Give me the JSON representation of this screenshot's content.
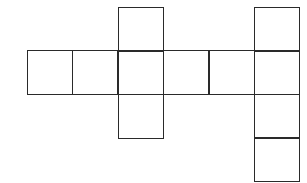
{
  "diagram": {
    "type": "cube-net-like grid of squares",
    "line_color": "#2a2a2a",
    "background": "#ffffff",
    "cell_size": 45,
    "cells": [
      {
        "name": "top-middle",
        "x": 118,
        "y": 7
      },
      {
        "name": "row-1",
        "x": 27,
        "y": 50
      },
      {
        "name": "row-2",
        "x": 72,
        "y": 50
      },
      {
        "name": "row-3-center",
        "x": 118,
        "y": 50
      },
      {
        "name": "row-4",
        "x": 163,
        "y": 50
      },
      {
        "name": "row-5",
        "x": 209,
        "y": 50
      },
      {
        "name": "bottom-middle",
        "x": 118,
        "y": 94
      },
      {
        "name": "right-col-1",
        "x": 254,
        "y": 7
      },
      {
        "name": "right-col-2",
        "x": 254,
        "y": 50
      },
      {
        "name": "right-col-3",
        "x": 254,
        "y": 94
      },
      {
        "name": "right-col-4",
        "x": 254,
        "y": 137
      }
    ]
  }
}
